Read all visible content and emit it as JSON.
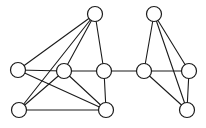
{
  "figure": {
    "background_color": "#ffffff",
    "edge_color": "#1b1b1b",
    "node_fill_color": "#ffffff",
    "node_stroke_color": "#1b1b1b",
    "node_radius": 7.5,
    "edge_width": 1.1,
    "node_stroke_width": 1.2,
    "width": 206,
    "height": 128
  },
  "chart_data": {
    "type": "graph",
    "directed": false,
    "weighted": false,
    "node_count": 10,
    "edge_count": 19,
    "nodes": [
      {
        "id": "n1",
        "label": "",
        "x": 95,
        "y": 14,
        "cluster": "left"
      },
      {
        "id": "n2",
        "label": "",
        "x": 18,
        "y": 70,
        "cluster": "left"
      },
      {
        "id": "n3",
        "label": "",
        "x": 64,
        "y": 71,
        "cluster": "left"
      },
      {
        "id": "n4",
        "label": "",
        "x": 104,
        "y": 71,
        "cluster": "left"
      },
      {
        "id": "n5",
        "label": "",
        "x": 19,
        "y": 110,
        "cluster": "left"
      },
      {
        "id": "n6",
        "label": "",
        "x": 106,
        "y": 110,
        "cluster": "left"
      },
      {
        "id": "n7",
        "label": "",
        "x": 154,
        "y": 14,
        "cluster": "right"
      },
      {
        "id": "n8",
        "label": "",
        "x": 144,
        "y": 71,
        "cluster": "right"
      },
      {
        "id": "n9",
        "label": "",
        "x": 189,
        "y": 71,
        "cluster": "right"
      },
      {
        "id": "n10",
        "label": "",
        "x": 187,
        "y": 110,
        "cluster": "right"
      }
    ],
    "edges": [
      {
        "source": "n1",
        "target": "n2",
        "kind": "cluster-left"
      },
      {
        "source": "n1",
        "target": "n3",
        "kind": "cluster-left"
      },
      {
        "source": "n1",
        "target": "n5",
        "kind": "cluster-left"
      },
      {
        "source": "n1",
        "target": "n4",
        "kind": "cluster-left"
      },
      {
        "source": "n2",
        "target": "n3",
        "kind": "cluster-left"
      },
      {
        "source": "n2",
        "target": "n6",
        "kind": "cluster-left"
      },
      {
        "source": "n3",
        "target": "n4",
        "kind": "cluster-left"
      },
      {
        "source": "n3",
        "target": "n6",
        "kind": "cluster-left"
      },
      {
        "source": "n5",
        "target": "n3",
        "kind": "cluster-left"
      },
      {
        "source": "n5",
        "target": "n6",
        "kind": "cluster-left"
      },
      {
        "source": "n4",
        "target": "n6",
        "kind": "cluster-left"
      },
      {
        "source": "n4",
        "target": "n8",
        "kind": "bridge"
      },
      {
        "source": "n7",
        "target": "n8",
        "kind": "cluster-right"
      },
      {
        "source": "n7",
        "target": "n9",
        "kind": "cluster-right"
      },
      {
        "source": "n7",
        "target": "n10",
        "kind": "cluster-right"
      },
      {
        "source": "n8",
        "target": "n9",
        "kind": "cluster-right"
      },
      {
        "source": "n8",
        "target": "n10",
        "kind": "cluster-right"
      },
      {
        "source": "n9",
        "target": "n10",
        "kind": "cluster-right"
      }
    ],
    "xlabel": "",
    "ylabel": "",
    "legend": [],
    "annotations": []
  }
}
